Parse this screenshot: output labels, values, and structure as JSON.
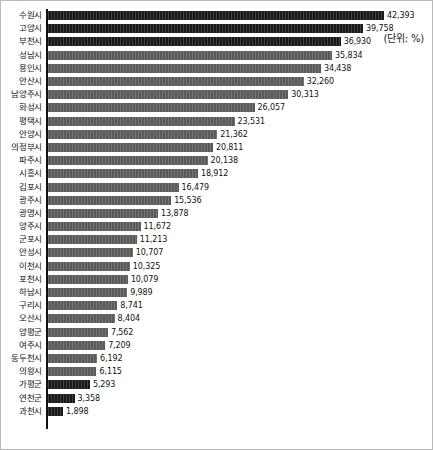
{
  "unit_note": "(단위: %)",
  "chart_data": {
    "type": "bar",
    "orientation": "horizontal",
    "title": "",
    "subtitle": "",
    "xlabel": "",
    "ylabel": "",
    "unit_note": "(단위: %)",
    "grid": false,
    "legend": null,
    "xlim": [
      0,
      42393
    ],
    "max_value": 42393,
    "categories": [
      "수원시",
      "고양시",
      "부천시",
      "성남시",
      "용인시",
      "안산시",
      "남양주시",
      "화성시",
      "평택시",
      "안양시",
      "의정부시",
      "파주시",
      "시흥시",
      "김포시",
      "광주시",
      "광명시",
      "양주시",
      "군포시",
      "안성시",
      "이천시",
      "포천시",
      "하남시",
      "구리시",
      "오산시",
      "양평군",
      "여주시",
      "동두천시",
      "의왕시",
      "가평군",
      "연천군",
      "과천시"
    ],
    "values": [
      42393,
      39758,
      36930,
      35834,
      34438,
      32260,
      30313,
      26057,
      23531,
      21362,
      20811,
      20138,
      18912,
      16479,
      15536,
      13878,
      11672,
      11213,
      10707,
      10325,
      10079,
      9989,
      8741,
      8404,
      7562,
      7209,
      6192,
      6115,
      5293,
      3358,
      1898
    ],
    "value_labels": [
      "42,393",
      "39,758",
      "36,930",
      "35,834",
      "34,438",
      "32,260",
      "30,313",
      "26,057",
      "23,531",
      "21,362",
      "20,811",
      "20,138",
      "18,912",
      "16,479",
      "15,536",
      "13,878",
      "11,672",
      "11,213",
      "10,707",
      "10,325",
      "10,079",
      "9,989",
      "8,741",
      "8,404",
      "7,562",
      "7,209",
      "6,192",
      "6,115",
      "5,293",
      "3,358",
      "1,898"
    ],
    "bar_shades": [
      "dark",
      "dark",
      "dark",
      "mid",
      "mid",
      "mid",
      "mid",
      "mid",
      "mid",
      "mid",
      "mid",
      "mid",
      "mid",
      "mid",
      "mid",
      "mid",
      "mid",
      "mid",
      "mid",
      "mid",
      "mid",
      "mid",
      "mid",
      "mid",
      "mid",
      "mid",
      "mid",
      "mid",
      "dark",
      "dark",
      "dark"
    ],
    "colors": {
      "bar_dark": "#191919",
      "bar_mid": "#5a5a5a",
      "axis": "#111111",
      "border": "#b9b9b9",
      "background": "#ffffff",
      "text": "#111111"
    }
  }
}
